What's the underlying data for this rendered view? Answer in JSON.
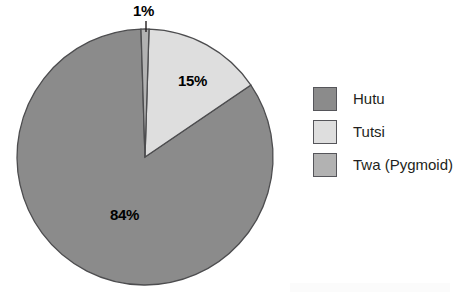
{
  "chart_data": {
    "type": "pie",
    "title": "",
    "categories": [
      "Hutu",
      "Tutsi",
      "Twa (Pygmoid)"
    ],
    "values": [
      84,
      15,
      1
    ],
    "value_labels": [
      "84%",
      "15%",
      "1%"
    ],
    "unit": "%",
    "legend_position": "right",
    "grid": false,
    "colors": [
      "#8b8b8b",
      "#dedede",
      "#b2b2b2"
    ],
    "stroke_color": "#4d4d4f",
    "start_angle_deg": 0,
    "direction": "clockwise",
    "slices": [
      {
        "name": "Hutu",
        "value": 84,
        "label": "84%",
        "color": "#8b8b8b",
        "label_inside": true
      },
      {
        "name": "Tutsi",
        "value": 15,
        "label": "15%",
        "color": "#dedede",
        "label_inside": true
      },
      {
        "name": "Twa (Pygmoid)",
        "value": 1,
        "label": "1%",
        "color": "#b2b2b2",
        "label_inside": false
      }
    ]
  },
  "labels": {
    "twa_pct": "1%",
    "tutsi_pct": "15%",
    "hutu_pct": "84%"
  },
  "legend": {
    "items": [
      {
        "label": "Hutu",
        "color": "#8b8b8b"
      },
      {
        "label": "Tutsi",
        "color": "#dedede"
      },
      {
        "label": "Twa (Pygmoid)",
        "color": "#b2b2b2"
      }
    ]
  }
}
